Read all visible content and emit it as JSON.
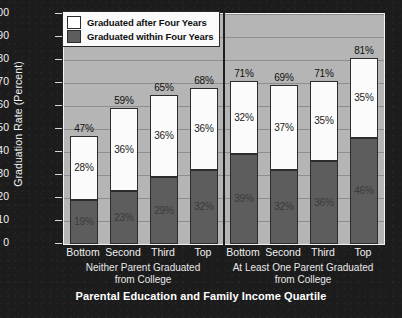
{
  "chart_data": {
    "type": "bar",
    "subtype": "stacked-bar",
    "title": "",
    "xlabel": "Parental Education and Family Income Quartile",
    "ylabel": "Graduation Rate (Percent)",
    "ylim": [
      0,
      100
    ],
    "yticks": [
      0,
      10,
      20,
      30,
      40,
      50,
      60,
      70,
      80,
      90,
      100
    ],
    "ytick_labels": [
      "0",
      "10",
      "20",
      "30",
      "40",
      "50",
      "60",
      "70",
      "80",
      "90",
      "100"
    ],
    "grid": true,
    "grid_axis": "y",
    "legend_position": "top-left",
    "categories": [
      "Bottom",
      "Second",
      "Third",
      "Top",
      "Bottom",
      "Second",
      "Third",
      "Top"
    ],
    "groups": [
      {
        "name": "Neither Parent Graduated from College",
        "line1": "Neither Parent Graduated",
        "line2": "from College",
        "categories": [
          "Bottom",
          "Second",
          "Third",
          "Top"
        ]
      },
      {
        "name": "At Least One Parent Graduated from College",
        "line1": "At Least One Parent Graduated",
        "line2": "from College",
        "categories": [
          "Bottom",
          "Second",
          "Third",
          "Top"
        ]
      }
    ],
    "series": [
      {
        "name": "Graduated within Four Years",
        "color": "#5d5d5d",
        "values": [
          19,
          23,
          29,
          32,
          39,
          32,
          36,
          46
        ],
        "labels": [
          "19%",
          "23%",
          "29%",
          "32%",
          "39%",
          "32%",
          "36%",
          "46%"
        ]
      },
      {
        "name": "Graduated after Four Years",
        "color": "#ffffff",
        "values": [
          28,
          36,
          36,
          36,
          32,
          37,
          35,
          35
        ],
        "labels": [
          "28%",
          "36%",
          "36%",
          "36%",
          "32%",
          "37%",
          "35%",
          "35%"
        ]
      }
    ],
    "totals": [
      47,
      59,
      65,
      68,
      71,
      69,
      71,
      81
    ],
    "total_labels": [
      "47%",
      "59%",
      "65%",
      "68%",
      "71%",
      "69%",
      "71%",
      "81%"
    ],
    "bars": [
      {
        "group": 0,
        "category": "Bottom",
        "within": 19,
        "within_label": "19%",
        "after": 28,
        "after_label": "28%",
        "total": 47,
        "total_label": "47%"
      },
      {
        "group": 0,
        "category": "Second",
        "within": 23,
        "within_label": "23%",
        "after": 36,
        "after_label": "36%",
        "total": 59,
        "total_label": "59%"
      },
      {
        "group": 0,
        "category": "Third",
        "within": 29,
        "within_label": "29%",
        "after": 36,
        "after_label": "36%",
        "total": 65,
        "total_label": "65%"
      },
      {
        "group": 0,
        "category": "Top",
        "within": 32,
        "within_label": "32%",
        "after": 36,
        "after_label": "36%",
        "total": 68,
        "total_label": "68%"
      },
      {
        "group": 1,
        "category": "Bottom",
        "within": 39,
        "within_label": "39%",
        "after": 32,
        "after_label": "32%",
        "total": 71,
        "total_label": "71%"
      },
      {
        "group": 1,
        "category": "Second",
        "within": 32,
        "within_label": "32%",
        "after": 37,
        "after_label": "37%",
        "total": 69,
        "total_label": "69%"
      },
      {
        "group": 1,
        "category": "Third",
        "within": 36,
        "within_label": "36%",
        "after": 35,
        "after_label": "35%",
        "total": 71,
        "total_label": "71%"
      },
      {
        "group": 1,
        "category": "Top",
        "within": 46,
        "within_label": "46%",
        "after": 35,
        "after_label": "35%",
        "total": 81,
        "total_label": "81%"
      }
    ]
  },
  "legend": {
    "items": [
      {
        "label": "Graduated after Four Years",
        "color": "#ffffff"
      },
      {
        "label": "Graduated within Four Years",
        "color": "#5d5d5d"
      }
    ]
  },
  "colors": {
    "figure_background": "#1c1c1c",
    "plot_background": "#b5b5b5",
    "gridline": "#8e8e8e",
    "bar_within": "#5d5d5d",
    "bar_after": "#ffffff",
    "axis_text": "#f0f0f0",
    "title_text": "#ffffff"
  }
}
